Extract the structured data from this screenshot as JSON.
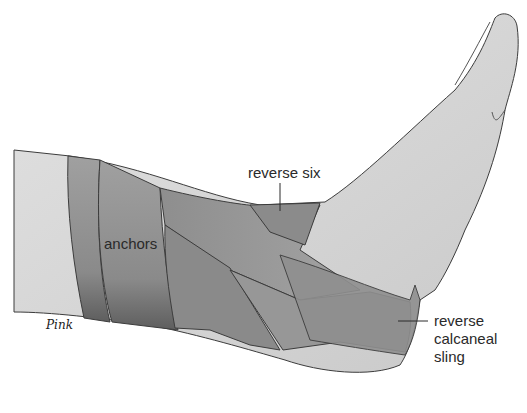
{
  "figure": {
    "labels": {
      "reverse_six": "reverse six",
      "anchors": "anchors",
      "calcaneal_sling_line1": "reverse",
      "calcaneal_sling_line2": "calcaneal",
      "calcaneal_sling_line3": "sling"
    },
    "signature": "Pink",
    "colors": {
      "skin": "#d6d6d6",
      "tape_dark": "#7d7d7d",
      "tape_mid": "#9a9a9a",
      "outline": "#3c3c3c",
      "label_text": "#2a2a2a"
    }
  }
}
